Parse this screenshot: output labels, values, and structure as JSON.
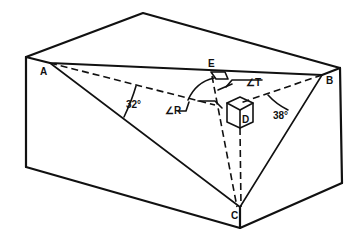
{
  "figure": {
    "points": {
      "A": "A",
      "B": "B",
      "C": "C",
      "D": "D",
      "E": "E"
    },
    "angles": {
      "angle_left": "32°",
      "angle_right": "38°",
      "angle_R": "∠R",
      "angle_T": "∠T"
    }
  }
}
